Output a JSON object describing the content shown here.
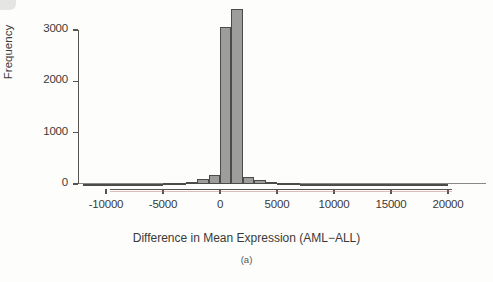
{
  "figure": {
    "panel_caption": "(a)"
  },
  "chart_data": {
    "type": "bar",
    "title": "",
    "subtitle": "",
    "xlabel": "Difference in Mean Expression (AML−ALL)",
    "ylabel": "Frequency",
    "xlim": [
      -12500,
      21000
    ],
    "ylim": [
      0,
      3500
    ],
    "xticks": [
      -10000,
      -5000,
      0,
      5000,
      10000,
      15000,
      20000
    ],
    "xtick_labels": [
      "-10000",
      "-5000",
      "0",
      "5000",
      "10000",
      "15000",
      "20000"
    ],
    "yticks": [
      0,
      1000,
      2000,
      3000
    ],
    "ytick_labels": [
      "0",
      "1000",
      "2000",
      "3000"
    ],
    "grid": false,
    "legend": "none",
    "bin_width": 1000,
    "bar_fill_color": "#9d9d9c",
    "bar_edge_color": "#4c4b49",
    "axis_color": "#555452",
    "bin_starts": [
      -12000,
      -11000,
      -10000,
      -9000,
      -8000,
      -7000,
      -6000,
      -5000,
      -4000,
      -3000,
      -2000,
      -1000,
      0,
      1000,
      2000,
      3000,
      4000,
      5000,
      6000,
      7000,
      8000,
      9000,
      10000,
      11000,
      12000,
      13000,
      14000,
      15000,
      16000,
      17000,
      18000,
      19000
    ],
    "values": [
      2,
      1,
      3,
      2,
      4,
      5,
      8,
      12,
      22,
      46,
      98,
      170,
      3050,
      3400,
      130,
      72,
      40,
      24,
      14,
      9,
      6,
      5,
      4,
      3,
      3,
      2,
      2,
      2,
      1,
      1,
      1,
      1
    ],
    "peak_bins": [
      {
        "range": "[-1000, 0)",
        "value": 3050
      },
      {
        "range": "[0, 1000)",
        "value": 3400
      }
    ]
  }
}
